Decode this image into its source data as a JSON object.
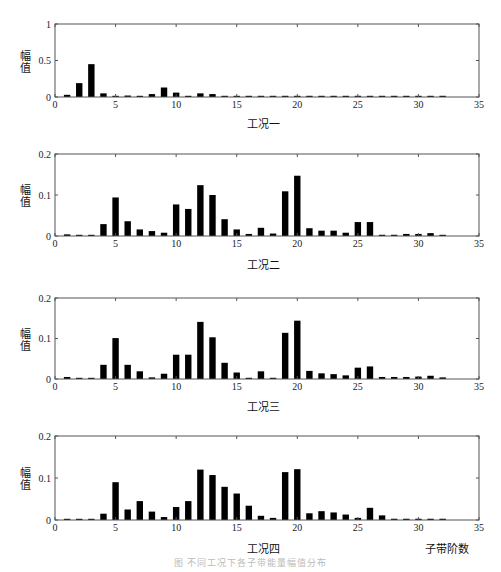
{
  "chart_data": [
    {
      "type": "bar",
      "title": "工况一",
      "xlabel": "工况一",
      "ylabel": "幅值",
      "xlim": [
        0,
        35
      ],
      "ylim": [
        0,
        1
      ],
      "xticks": [
        0,
        5,
        10,
        15,
        20,
        25,
        30,
        35
      ],
      "yticks": [
        "0",
        "0.5",
        "1"
      ],
      "grid": false,
      "x": [
        1,
        2,
        3,
        4,
        5,
        6,
        7,
        8,
        9,
        10,
        11,
        12,
        13,
        14,
        15,
        16,
        17,
        18,
        19,
        20,
        21,
        22,
        23,
        24,
        25,
        26,
        27,
        28,
        29,
        30,
        31,
        32
      ],
      "values": [
        0.03,
        0.19,
        0.45,
        0.05,
        0.01,
        0.02,
        0.01,
        0.04,
        0.13,
        0.06,
        0.01,
        0.05,
        0.04,
        0.01,
        0.01,
        0.01,
        0.01,
        0.01,
        0.01,
        0.01,
        0.01,
        0.01,
        0.01,
        0.01,
        0.01,
        0.01,
        0.01,
        0.01,
        0.01,
        0.01,
        0.01,
        0.01
      ]
    },
    {
      "type": "bar",
      "title": "工况二",
      "xlabel": "工况二",
      "ylabel": "幅值",
      "xlim": [
        0,
        35
      ],
      "ylim": [
        0,
        0.2
      ],
      "xticks": [
        0,
        5,
        10,
        15,
        20,
        25,
        30,
        35
      ],
      "yticks": [
        "0",
        "0.1",
        "0.2"
      ],
      "grid": false,
      "x": [
        1,
        2,
        3,
        4,
        5,
        6,
        7,
        8,
        9,
        10,
        11,
        12,
        13,
        14,
        15,
        16,
        17,
        18,
        19,
        20,
        21,
        22,
        23,
        24,
        25,
        26,
        27,
        28,
        29,
        30,
        31,
        32
      ],
      "values": [
        0.004,
        0.002,
        0.002,
        0.029,
        0.094,
        0.036,
        0.016,
        0.012,
        0.008,
        0.077,
        0.066,
        0.124,
        0.1,
        0.041,
        0.016,
        0.005,
        0.02,
        0.006,
        0.109,
        0.147,
        0.019,
        0.013,
        0.013,
        0.008,
        0.034,
        0.034,
        0.003,
        0.003,
        0.005,
        0.005,
        0.007,
        0.002
      ]
    },
    {
      "type": "bar",
      "title": "工况三",
      "xlabel": "工况三",
      "ylabel": "幅值",
      "xlim": [
        0,
        35
      ],
      "ylim": [
        0,
        0.2
      ],
      "xticks": [
        0,
        5,
        10,
        15,
        20,
        25,
        30,
        35
      ],
      "yticks": [
        "0",
        "0.1",
        "0.2"
      ],
      "grid": false,
      "x": [
        1,
        2,
        3,
        4,
        5,
        6,
        7,
        8,
        9,
        10,
        11,
        12,
        13,
        14,
        15,
        16,
        17,
        18,
        19,
        20,
        21,
        22,
        23,
        24,
        25,
        26,
        27,
        28,
        29,
        30,
        31,
        32
      ],
      "values": [
        0.005,
        0.002,
        0.002,
        0.035,
        0.101,
        0.035,
        0.019,
        0.004,
        0.013,
        0.06,
        0.06,
        0.141,
        0.103,
        0.04,
        0.016,
        0.003,
        0.019,
        0.003,
        0.114,
        0.144,
        0.02,
        0.014,
        0.012,
        0.009,
        0.028,
        0.031,
        0.005,
        0.005,
        0.005,
        0.006,
        0.008,
        0.004
      ]
    },
    {
      "type": "bar",
      "title": "工况四",
      "xlabel": "子带阶数",
      "ylabel": "幅值",
      "xlim": [
        0,
        35
      ],
      "ylim": [
        0,
        0.2
      ],
      "xticks": [
        0,
        5,
        10,
        15,
        20,
        25,
        30,
        35
      ],
      "yticks": [
        "0",
        "0.1",
        "0.2"
      ],
      "grid": false,
      "x": [
        1,
        2,
        3,
        4,
        5,
        6,
        7,
        8,
        9,
        10,
        11,
        12,
        13,
        14,
        15,
        16,
        17,
        18,
        19,
        20,
        21,
        22,
        23,
        24,
        25,
        26,
        27,
        28,
        29,
        30,
        31,
        32
      ],
      "values": [
        0.002,
        0.002,
        0.002,
        0.015,
        0.09,
        0.025,
        0.045,
        0.02,
        0.007,
        0.031,
        0.045,
        0.12,
        0.107,
        0.079,
        0.063,
        0.034,
        0.01,
        0.005,
        0.114,
        0.121,
        0.016,
        0.021,
        0.018,
        0.013,
        0.005,
        0.029,
        0.011,
        0.003,
        0.003,
        0.003,
        0.003,
        0.003
      ]
    }
  ],
  "panels": [
    {
      "ylabel": "幅值",
      "condition": "工况一",
      "yticks": [
        "0",
        "0.5",
        "1"
      ]
    },
    {
      "ylabel": "幅值",
      "condition": "工况二",
      "yticks": [
        "0",
        "0.1",
        "0.2"
      ]
    },
    {
      "ylabel": "幅值",
      "condition": "工况三",
      "yticks": [
        "0",
        "0.1",
        "0.2"
      ]
    },
    {
      "ylabel": "幅值",
      "condition": "工况四",
      "yticks": [
        "0",
        "0.1",
        "0.2"
      ]
    }
  ],
  "xticks": [
    "0",
    "5",
    "10",
    "15",
    "20",
    "25",
    "30",
    "35"
  ],
  "xaxis_title": "子带阶数",
  "caption": "图 不同工况下各子带能量幅值分布",
  "colors": {
    "bar": "#000000",
    "axis": "#555555"
  }
}
